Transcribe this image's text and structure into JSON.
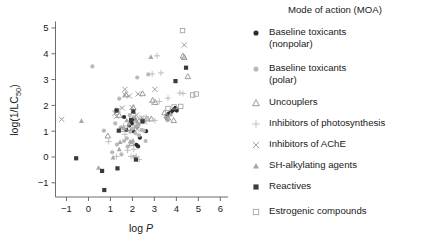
{
  "chart_data": {
    "type": "scatter",
    "title": "",
    "xlabel": "log P",
    "ylabel": "log(1/LC50)",
    "ylabel_base": "log(1/LC",
    "ylabel_sub": "50",
    "ylabel_tail": ")",
    "xlabel_prefix": "log ",
    "xlabel_italic": "P",
    "xlim": [
      -1.5,
      6.35
    ],
    "ylim": [
      -1.55,
      5.25
    ],
    "xticks": [
      -1,
      0,
      1,
      2,
      3,
      4,
      5,
      6
    ],
    "yticks": [
      -1,
      0,
      1,
      2,
      3,
      4,
      5
    ],
    "grid": false,
    "legend_position": "right",
    "legend_title": "Mode of action (MOA)",
    "series": [
      {
        "name": "Baseline toxicants (nonpolar)",
        "label_lines": "Baseline toxicants\n(nonpolar)",
        "marker": "filled-circle",
        "color": "#2b2b2b",
        "points": [
          [
            1.28,
            1.81
          ],
          [
            1.62,
            1.55
          ],
          [
            1.98,
            1.3
          ],
          [
            2.1,
            1.45
          ],
          [
            2.22,
            1.18
          ],
          [
            2.18,
            0.47
          ],
          [
            2.26,
            0.41
          ],
          [
            2.34,
            0.75
          ],
          [
            2.48,
            1.42
          ],
          [
            2.62,
            1.0
          ],
          [
            1.86,
            1.22
          ],
          [
            1.72,
            1.05
          ],
          [
            3.58,
            1.62
          ],
          [
            3.66,
            1.68
          ],
          [
            3.74,
            1.72
          ],
          [
            3.8,
            1.78
          ],
          [
            3.86,
            1.82
          ],
          [
            3.92,
            1.86
          ],
          [
            3.96,
            1.9
          ],
          [
            4.02,
            1.8
          ],
          [
            2.04,
            1.0
          ],
          [
            1.92,
            1.38
          ]
        ]
      },
      {
        "name": "Baseline toxicants (polar)",
        "label_lines": "Baseline toxicants\n(polar)",
        "marker": "filled-circle-light",
        "color": "#b9b9b9",
        "points": [
          [
            0.18,
            3.51
          ],
          [
            0.7,
            1.02
          ],
          [
            1.08,
            0.18
          ],
          [
            1.3,
            0.48
          ],
          [
            1.5,
            0.1
          ],
          [
            1.62,
            0.62
          ],
          [
            1.78,
            0.4
          ],
          [
            1.9,
            0.98
          ],
          [
            2.02,
            1.1
          ],
          [
            2.14,
            0.92
          ],
          [
            2.24,
            1.22
          ],
          [
            2.3,
            0.84
          ],
          [
            2.42,
            1.05
          ],
          [
            2.52,
            1.02
          ],
          [
            2.6,
            0.62
          ],
          [
            2.08,
            0.02
          ],
          [
            1.96,
            0.56
          ],
          [
            2.72,
            3.2
          ],
          [
            2.22,
            3.08
          ],
          [
            1.4,
            2.26
          ],
          [
            1.88,
            1.62
          ],
          [
            2.08,
            1.55
          ],
          [
            2.16,
            1.38
          ],
          [
            1.74,
            0.72
          ],
          [
            3.54,
            1.52
          ],
          [
            3.6,
            1.42
          ],
          [
            1.46,
            1.14
          ],
          [
            1.22,
            1.3
          ]
        ]
      },
      {
        "name": "Uncouplers",
        "label_lines": "Uncouplers",
        "marker": "open-triangle",
        "color": "#8a8a8a",
        "points": [
          [
            0.88,
            0.82
          ],
          [
            1.4,
            1.62
          ],
          [
            1.52,
            1.08
          ],
          [
            1.7,
            2.42
          ],
          [
            1.82,
            1.12
          ],
          [
            1.96,
            0.52
          ],
          [
            2.04,
            1.92
          ],
          [
            2.3,
            1.4
          ],
          [
            2.46,
            2.46
          ],
          [
            2.66,
            1.48
          ],
          [
            2.92,
            2.2
          ],
          [
            3.04,
            2.12
          ],
          [
            3.46,
            1.72
          ],
          [
            3.56,
            1.6
          ],
          [
            3.62,
            1.52
          ],
          [
            4.3,
            3.92
          ],
          [
            4.36,
            3.86
          ],
          [
            4.52,
            3.12
          ],
          [
            3.88,
            1.42
          ],
          [
            2.86,
            1.48
          ]
        ]
      },
      {
        "name": "Inhibitors of photosynthesis",
        "label_lines": "Inhibitors of photosynthesis",
        "marker": "plus",
        "color": "#bdbdbd",
        "points": [
          [
            0.92,
            0.6
          ],
          [
            1.28,
            0.02
          ],
          [
            1.78,
            0.26
          ],
          [
            1.94,
            0.02
          ],
          [
            2.06,
            0.3
          ],
          [
            2.18,
            0.02
          ],
          [
            2.3,
            -0.1
          ],
          [
            2.08,
            1.22
          ],
          [
            2.4,
            1.5
          ],
          [
            2.52,
            1.38
          ],
          [
            2.62,
            1.55
          ],
          [
            2.88,
            2.12
          ],
          [
            2.9,
            3.22
          ],
          [
            2.72,
            1.48
          ],
          [
            3.02,
            1.42
          ],
          [
            3.22,
            2.15
          ],
          [
            3.3,
            3.26
          ],
          [
            3.12,
            3.92
          ],
          [
            4.16,
            2.48
          ],
          [
            4.3,
            2.46
          ],
          [
            3.62,
            2.28
          ],
          [
            1.6,
            1.2
          ],
          [
            1.66,
            0.88
          ]
        ]
      },
      {
        "name": "Inhibitors of AChE",
        "label_lines": "Inhibitors of AChE",
        "marker": "cross",
        "color": "#9a9a9a",
        "points": [
          [
            -1.22,
            1.46
          ],
          [
            1.2,
            1.7
          ],
          [
            1.28,
            1.58
          ],
          [
            1.66,
            2.62
          ],
          [
            1.66,
            2.4
          ],
          [
            1.98,
            1.92
          ],
          [
            2.04,
            1.78
          ],
          [
            2.12,
            1.45
          ],
          [
            2.18,
            1.62
          ],
          [
            2.26,
            2.44
          ],
          [
            2.42,
            1.52
          ],
          [
            2.56,
            1.36
          ],
          [
            1.86,
            2.36
          ],
          [
            1.54,
            1.9
          ],
          [
            4.36,
            4.34
          ],
          [
            3.02,
            2.62
          ],
          [
            2.22,
            1.08
          ],
          [
            1.36,
            1.82
          ]
        ]
      },
      {
        "name": "SH-alkylating agents",
        "label_lines": "SH-alkylating agents",
        "marker": "filled-triangle-light",
        "color": "#a8a8a8",
        "points": [
          [
            -0.32,
            1.4
          ],
          [
            0.46,
            -0.42
          ],
          [
            1.12,
            -0.02
          ],
          [
            1.4,
            0.3
          ],
          [
            1.62,
            1.12
          ],
          [
            1.84,
            1.3
          ],
          [
            1.9,
            0.6
          ],
          [
            2.02,
            0.64
          ],
          [
            2.16,
            1.18
          ],
          [
            2.84,
            3.88
          ],
          [
            2.28,
            1.3
          ],
          [
            1.74,
            1.42
          ],
          [
            1.44,
            0.58
          ],
          [
            3.74,
            1.66
          ]
        ]
      },
      {
        "name": "Reactives",
        "label_lines": "Reactives",
        "marker": "filled-square",
        "color": "#3a3a3a",
        "points": [
          [
            -0.56,
            -0.05
          ],
          [
            0.62,
            -0.54
          ],
          [
            0.72,
            -1.28
          ],
          [
            1.32,
            -0.44
          ],
          [
            1.38,
            1.02
          ],
          [
            1.94,
            1.44
          ],
          [
            2.04,
            1.76
          ],
          [
            2.16,
            -0.1
          ],
          [
            3.96,
            2.94
          ],
          [
            4.44,
            3.46
          ],
          [
            1.28,
            1.8
          ],
          [
            2.46,
            1.38
          ]
        ]
      },
      {
        "name": "Estrogenic compounds",
        "label_lines": "Estrogenic compounds",
        "marker": "open-square",
        "color": "#a0a0a0",
        "points": [
          [
            3.62,
            1.88
          ],
          [
            3.9,
            1.94
          ],
          [
            4.28,
            4.9
          ],
          [
            4.9,
            2.44
          ],
          [
            4.74,
            2.4
          ],
          [
            4.2,
            1.96
          ]
        ]
      }
    ]
  }
}
